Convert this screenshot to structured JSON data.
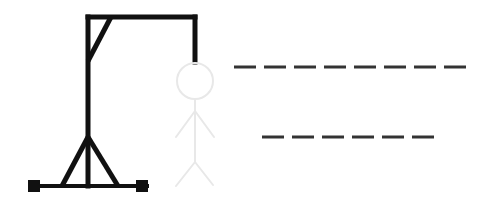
{
  "game": {
    "title": "Hangman",
    "colors": {
      "gallows": "#111111",
      "figure": "#e8e8e8",
      "blank": "#333333",
      "background": "#ffffff"
    },
    "gallows": {
      "base_y": 186,
      "base_x1": 33,
      "base_x2": 147,
      "pole_x": 88,
      "top_y": 17,
      "beam_x2": 195,
      "rope_bottom_y": 62,
      "brace": {
        "x1": 111,
        "y1": 17,
        "x2": 88,
        "y2": 61
      },
      "tripod": {
        "apex_y": 137,
        "left_x": 62,
        "right_x": 118
      },
      "feet": [
        {
          "x": 28,
          "y": 180,
          "size": 12
        },
        {
          "x": 136,
          "y": 180,
          "size": 12
        }
      ]
    },
    "figure": {
      "state": "not-yet-drawn",
      "head": {
        "cx": 195,
        "cy": 81,
        "r": 18
      },
      "body": {
        "x": 195,
        "y1": 99,
        "y2": 162
      },
      "arms": [
        {
          "x1": 195,
          "y1": 111,
          "x2": 176,
          "y2": 137
        },
        {
          "x1": 195,
          "y1": 111,
          "x2": 214,
          "y2": 137
        }
      ],
      "legs": [
        {
          "x1": 195,
          "y1": 162,
          "x2": 176,
          "y2": 186
        },
        {
          "x1": 195,
          "y1": 162,
          "x2": 213,
          "y2": 185
        }
      ]
    },
    "word": {
      "lines": [
        {
          "y": 67,
          "start_x": 234,
          "letters": [
            "",
            "",
            "",
            "",
            "",
            "",
            "",
            ""
          ]
        },
        {
          "y": 137,
          "start_x": 262,
          "letters": [
            "",
            "",
            "",
            "",
            "",
            ""
          ]
        }
      ],
      "blank_width": 22,
      "blank_pitch": 30
    }
  }
}
